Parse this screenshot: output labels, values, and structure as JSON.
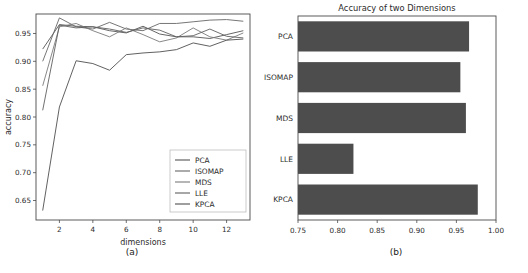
{
  "figure": {
    "panel_a_caption": "(a)",
    "panel_b_caption": "(b)"
  },
  "chart_data": [
    {
      "id": "line-chart",
      "type": "line",
      "title": "",
      "xlabel": "dimensions",
      "ylabel": "accuracy",
      "x": [
        1,
        2,
        3,
        4,
        5,
        6,
        7,
        8,
        9,
        10,
        11,
        12,
        13
      ],
      "xlim": [
        0.6,
        13.4
      ],
      "ylim": [
        0.615,
        0.985
      ],
      "xticks": [
        2,
        4,
        6,
        8,
        10,
        12
      ],
      "xticklabels": [
        "2",
        "4",
        "6",
        "8",
        "10",
        "12"
      ],
      "yticks": [
        0.65,
        0.7,
        0.75,
        0.8,
        0.85,
        0.9,
        0.95
      ],
      "yticklabels": [
        "0.65",
        "0.70",
        "0.75",
        "0.80",
        "0.85",
        "0.90",
        "0.95"
      ],
      "grid": false,
      "legend_position": "lower right",
      "series": [
        {
          "name": "PCA",
          "color": "#555555",
          "values": [
            0.922,
            0.966,
            0.963,
            0.962,
            0.955,
            0.951,
            0.963,
            0.949,
            0.944,
            0.944,
            0.941,
            0.948,
            0.955
          ]
        },
        {
          "name": "ISOMAP",
          "color": "#666666",
          "values": [
            0.9,
            0.978,
            0.962,
            0.958,
            0.97,
            0.958,
            0.955,
            0.968,
            0.968,
            0.971,
            0.974,
            0.975,
            0.972
          ]
        },
        {
          "name": "MDS",
          "color": "#7a7a7a",
          "values": [
            0.856,
            0.962,
            0.968,
            0.955,
            0.944,
            0.96,
            0.948,
            0.935,
            0.942,
            0.96,
            0.944,
            0.938,
            0.951
          ]
        },
        {
          "name": "LLE",
          "color": "#606060",
          "values": [
            0.812,
            0.965,
            0.96,
            0.962,
            0.958,
            0.952,
            0.96,
            0.956,
            0.944,
            0.946,
            0.958,
            0.945,
            0.942
          ]
        },
        {
          "name": "KPCA",
          "color": "#4f4f4f",
          "values": [
            0.632,
            0.818,
            0.901,
            0.896,
            0.884,
            0.912,
            0.915,
            0.917,
            0.921,
            0.933,
            0.927,
            0.938,
            0.94
          ]
        }
      ]
    },
    {
      "id": "bar-chart",
      "type": "bar",
      "orientation": "horizontal",
      "title": "Accuracy of two Dimensions",
      "xlabel": "",
      "ylabel": "",
      "categories": [
        "PCA",
        "ISOMAP",
        "MDS",
        "LLE",
        "KPCA"
      ],
      "values": [
        0.966,
        0.955,
        0.962,
        0.82,
        0.977
      ],
      "bar_color": "#4d4d4d",
      "xlim": [
        0.75,
        1.0
      ],
      "xticks": [
        0.75,
        0.8,
        0.85,
        0.9,
        0.95,
        1.0
      ],
      "xticklabels": [
        "0.75",
        "0.80",
        "0.85",
        "0.90",
        "0.95",
        "1.00"
      ],
      "grid": false
    }
  ]
}
